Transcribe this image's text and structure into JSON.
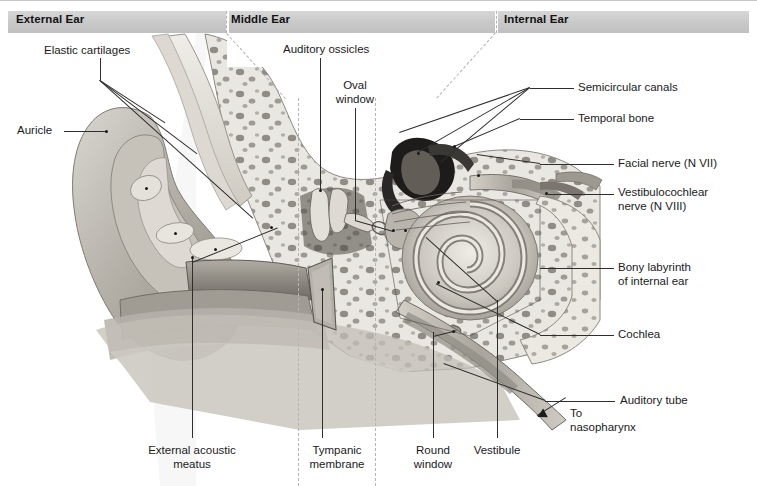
{
  "figure": {
    "width": 757,
    "height": 486,
    "background": "#ffffff"
  },
  "regions": [
    {
      "id": "external",
      "label": "External Ear",
      "x": 16,
      "band_start": 8,
      "band_end": 226
    },
    {
      "id": "middle",
      "label": "Middle Ear",
      "x": 229,
      "band_start": 226,
      "band_end": 498
    },
    {
      "id": "internal",
      "label": "Internal Ear",
      "x": 502,
      "band_start": 498,
      "band_end": 749
    }
  ],
  "dividers": {
    "color": "#b4b4b4",
    "style": "dashed",
    "vertical": [
      {
        "x": 226,
        "y1": 11,
        "y2": 33
      },
      {
        "x": 498,
        "y1": 11,
        "y2": 33
      },
      {
        "x": 298,
        "y1": 120,
        "y2": 486
      },
      {
        "x": 375,
        "y1": 120,
        "y2": 486
      }
    ]
  },
  "labels": [
    {
      "name": "elastic-cartilages",
      "text": "Elastic cartilages",
      "x": 44,
      "y": 44,
      "align": "left"
    },
    {
      "name": "auricle",
      "text": "Auricle",
      "x": 17,
      "y": 124,
      "align": "left"
    },
    {
      "name": "auditory-ossicles",
      "text": "Auditory ossicles",
      "x": 283,
      "y": 43,
      "align": "left"
    },
    {
      "name": "oval-window",
      "text": "Oval\nwindow",
      "x": 331,
      "y": 79,
      "align": "center"
    },
    {
      "name": "semicircular-canals",
      "text": "Semicircular canals",
      "x": 578,
      "y": 81,
      "align": "left"
    },
    {
      "name": "temporal-bone",
      "text": "Temporal bone",
      "x": 578,
      "y": 112,
      "align": "left"
    },
    {
      "name": "facial-nerve",
      "text": "Facial nerve (N VII)",
      "x": 618,
      "y": 157,
      "align": "left"
    },
    {
      "name": "vestibulocochlear-nerve",
      "text": "Vestibulocochlear\nnerve (N VIII)",
      "x": 618,
      "y": 186,
      "align": "left"
    },
    {
      "name": "bony-labyrinth",
      "text": "Bony labyrinth\nof internal ear",
      "x": 618,
      "y": 261,
      "align": "left"
    },
    {
      "name": "cochlea",
      "text": "Cochlea",
      "x": 618,
      "y": 328,
      "align": "left"
    },
    {
      "name": "auditory-tube",
      "text": "Auditory tube",
      "x": 620,
      "y": 394,
      "align": "left"
    },
    {
      "name": "to-nasopharynx",
      "text": "To\nnasopharynx",
      "x": 570,
      "y": 407,
      "align": "left"
    },
    {
      "name": "external-acoustic-meatus",
      "text": "External acoustic\nmeatus",
      "x": 192,
      "y": 448,
      "align": "center"
    },
    {
      "name": "tympanic-membrane",
      "text": "Tympanic\nmembrane",
      "x": 337,
      "y": 448,
      "align": "center"
    },
    {
      "name": "round-window",
      "text": "Round\nwindow",
      "x": 433,
      "y": 448,
      "align": "center"
    },
    {
      "name": "vestibule",
      "text": "Vestibule",
      "x": 497,
      "y": 448,
      "align": "center"
    }
  ],
  "colors": {
    "header_band": "#cccccc",
    "header_text": "#121212",
    "label_text": "#1a1a1a",
    "leader_line": "#2e2e2e",
    "divider": "#b4b4b4",
    "bone_light": "#e8e6e0",
    "bone_mid": "#cfcbc2",
    "bone_dark": "#8f8a82",
    "cavity_dark": "#1e1e1e",
    "tissue": "#b9b5ad",
    "tissue_light": "#d8d5ce",
    "page": "#ffffff"
  }
}
